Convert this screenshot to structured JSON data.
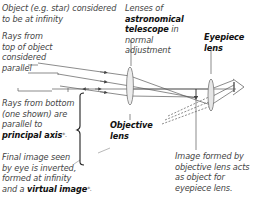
{
  "diagram": {
    "title": "Astronomical telescope in normal adjustment",
    "labels": {
      "object": [
        "Object (e.g. star) considered",
        "to be at infinity"
      ],
      "rays_top": [
        "Rays from",
        "top of object",
        "considered",
        "parallel"
      ],
      "rays_bottom": [
        "Rays from bottom",
        "(one shown) are",
        "parallel to"
      ],
      "principal_axis": "principal axis",
      "principal_axis_mark": "*.",
      "lenses_of": "Lenses of",
      "astronomical": "astronomical",
      "telescope": "telescope",
      "telescope_suffix": " in",
      "normal": "normal",
      "adjustment": "adjustment",
      "eyepiece_lens": [
        "Eyepiece",
        "lens"
      ],
      "objective_lens": [
        "Objective",
        "lens"
      ],
      "final_image": [
        "Final image seen",
        "by eye is inverted,",
        "formed at infinity"
      ],
      "final_image_last_prefix": "and a ",
      "virtual_image": "virtual image",
      "virtual_image_mark": "*.",
      "image_formed": [
        "Image formed by",
        "objective lens acts",
        "as object for",
        "eyepiece lens."
      ]
    },
    "components": [
      "objective-lens",
      "eyepiece-lens",
      "eye",
      "principal-axis",
      "intermediate-image-arrow",
      "incoming-parallel-rays",
      "outgoing-parallel-rays"
    ],
    "colors": {
      "line": "#555555",
      "text": "#444444",
      "bold_text": "#111111",
      "lens_fill": "#e8e8e8"
    }
  }
}
